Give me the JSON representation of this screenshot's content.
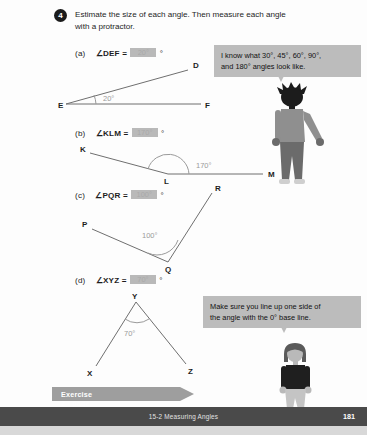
{
  "problem": {
    "number": "4",
    "prompt": "Estimate the size of each angle. Then measure each angle with a protractor."
  },
  "parts": [
    {
      "tag": "(a)",
      "expr": "∠DEF =",
      "answer": "20°",
      "blank_text": "20°",
      "degree_suffix": "°",
      "figure": {
        "vertices": [
          "E",
          "D",
          "F"
        ],
        "angle_label": "20°"
      }
    },
    {
      "tag": "(b)",
      "expr": "∠KLM =",
      "answer": "170°",
      "blank_text": "170°",
      "degree_suffix": "°",
      "figure": {
        "vertices": [
          "K",
          "L",
          "M"
        ],
        "angle_label": "170°"
      }
    },
    {
      "tag": "(c)",
      "expr": "∠PQR =",
      "answer": "100°",
      "blank_text": "100°",
      "degree_suffix": "°",
      "figure": {
        "vertices": [
          "P",
          "Q",
          "R"
        ],
        "angle_label": "100°"
      }
    },
    {
      "tag": "(d)",
      "expr": "∠XYZ =",
      "answer": "70°",
      "blank_text": "70°",
      "degree_suffix": "°",
      "figure": {
        "vertices": [
          "X",
          "Y",
          "Z"
        ],
        "angle_label": "70°"
      }
    }
  ],
  "bubbles": [
    {
      "line1": "I know what 30°, 45°, 60°, 90°,",
      "line2": "and 180° angles look like."
    },
    {
      "line1": "Make sure you line up one side of",
      "line2": "the angle with the 0° base line."
    }
  ],
  "exercise_banner": {
    "label": "Exercise 2 · page 135"
  },
  "footer": {
    "chapter": "15-2  Measuring Angles",
    "page_number": "181"
  },
  "colors": {
    "banner": "#9e9e9e",
    "footer": "#4a4a4a",
    "bubble": "#bcbcbc",
    "blank": "#b9b9b9",
    "line": "#6f6f6f",
    "arc": "#9a9a9a"
  }
}
